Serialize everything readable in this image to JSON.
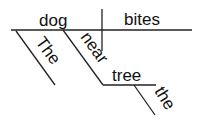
{
  "diagram": {
    "type": "sentence-diagram",
    "subject": "dog",
    "verb": "bites",
    "modifiers": {
      "article_subject": "The",
      "preposition": "near",
      "prep_object": "tree",
      "article_object": "the"
    },
    "line_color": "#222222",
    "text_color": "#111111"
  }
}
